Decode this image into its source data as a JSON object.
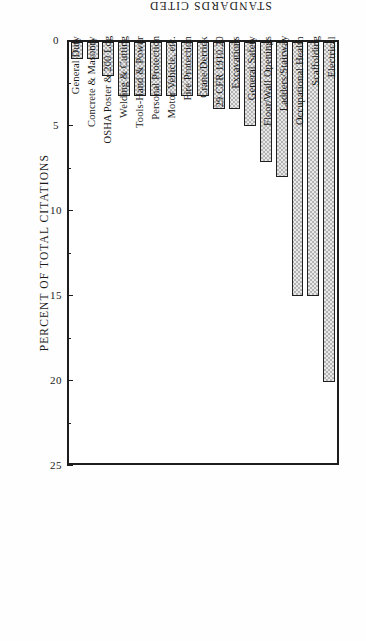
{
  "chart_data": {
    "type": "bar",
    "orientation": "vertical-rotated",
    "title": "",
    "xlabel": "STANDARDS CITED",
    "ylabel": "PERCENT OF TOTAL CITATIONS",
    "ylim": [
      0,
      25
    ],
    "yticks": [
      0,
      5,
      10,
      15,
      20,
      25
    ],
    "ytick_labels": [
      "0",
      "5",
      "10",
      "15",
      "20",
      "25"
    ],
    "minor_ticks": [
      2.5,
      7.5,
      12.5,
      17.5,
      22.5
    ],
    "grid": false,
    "legend": null,
    "categories": [
      "Electrical",
      "Scaffolding",
      "Occupational Health",
      "Ladders/Stairway",
      "Floor/Wall Openings",
      "General Safety",
      "Excavations",
      "29 CFR 1910.20",
      "Crane/Derrick",
      "Fire Protection",
      "Motor Vehicle, etc.",
      "Personal Protection",
      "Tools-Hand & Power",
      "Welding & Cutting",
      "OSHA Poster & 200 Log",
      "Concrete & Masonry",
      "General Duty"
    ],
    "values": [
      20.2,
      15.1,
      15.1,
      8.0,
      7.1,
      5.0,
      4.0,
      4.0,
      3.2,
      3.2,
      3.2,
      3.2,
      3.2,
      3.2,
      2.0,
      1.0,
      1.0
    ],
    "bar_fill_color": "#c9c9c9",
    "bar_edge_color": "#1f1f1f",
    "frame_color": "#1d1d1d",
    "background_color": "#ffffff"
  }
}
